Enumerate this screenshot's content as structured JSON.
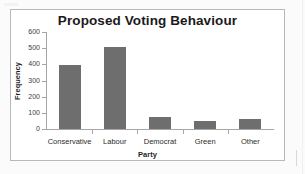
{
  "chart_data": {
    "type": "bar",
    "title": "Proposed Voting Behaviour",
    "xlabel": "Party",
    "ylabel": "Frequency",
    "categories": [
      "Conservative",
      "Labour",
      "Democrat",
      "Green",
      "Other"
    ],
    "values": [
      395,
      510,
      75,
      50,
      60
    ],
    "ylim": [
      0,
      600
    ],
    "yticks": [
      0,
      100,
      200,
      300,
      400,
      500,
      600
    ],
    "ytick_labels": [
      "0",
      "100",
      "200",
      "300",
      "400",
      "500",
      "600"
    ],
    "grid": false,
    "legend": false,
    "bar_color": "#6e6e6e",
    "axis_color": "#a6a6a6",
    "plot_background": "#ffffff",
    "border_color": "#b9b9b9"
  }
}
